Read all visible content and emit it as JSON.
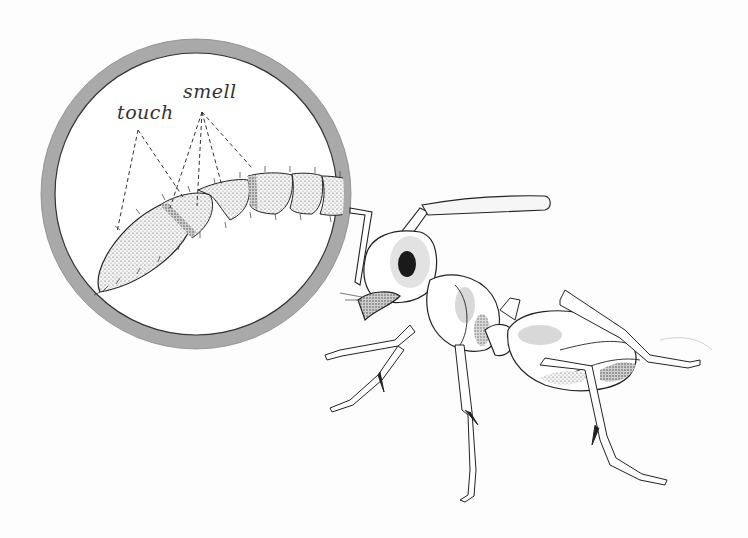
{
  "illustration": {
    "subject": "ant with magnified antenna",
    "labels": {
      "touch": "touch",
      "smell": "smell"
    },
    "colors": {
      "ring": "#a8a8a8",
      "ink": "#222222",
      "shade": "#c8c8c8",
      "background": "#fdfdfd"
    }
  }
}
